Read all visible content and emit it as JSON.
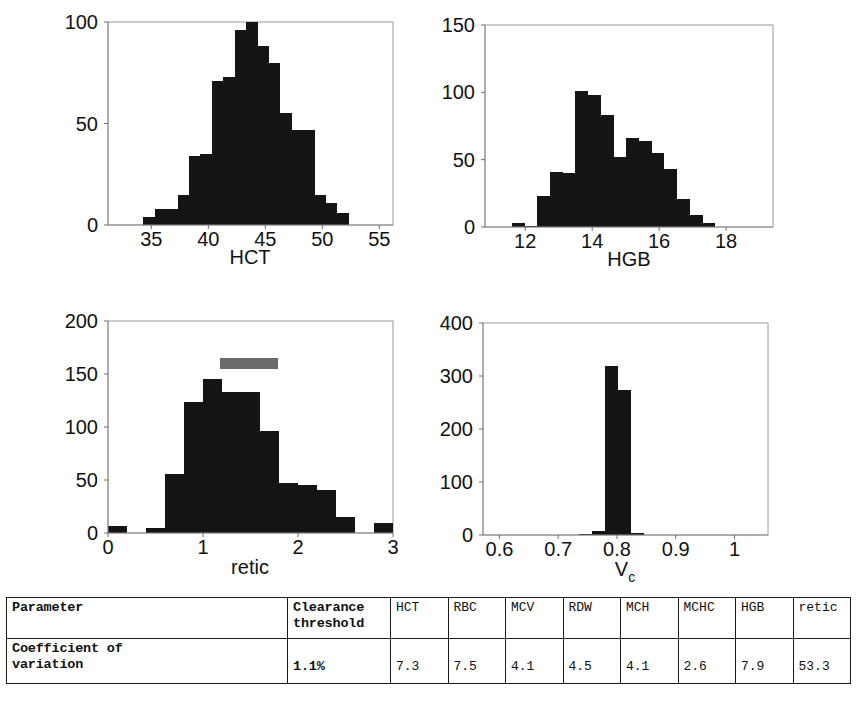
{
  "chart_data": [
    {
      "id": "hct",
      "type": "bar",
      "title": "",
      "xlabel": "HCT",
      "ylabel": "",
      "xlim": [
        31.2,
        56.2
      ],
      "ylim": [
        0,
        100
      ],
      "xticks": [
        35,
        40,
        45,
        50,
        55
      ],
      "xticklabels": [
        "35",
        "40",
        "45",
        "50",
        "55"
      ],
      "yticks": [
        0,
        50,
        100
      ],
      "yticklabels": [
        "0",
        "50",
        "100"
      ],
      "grid": false,
      "legend": "none",
      "bin_width": 1.02,
      "bin_starts": [
        34.3,
        35.3,
        36.3,
        37.3,
        38.3,
        39.3,
        40.3,
        41.3,
        42.3,
        43.3,
        44.3,
        45.3,
        46.3,
        47.3,
        48.3,
        49.3,
        50.3,
        51.3
      ],
      "values": [
        4,
        8,
        8,
        15,
        34,
        35,
        71,
        73,
        96,
        100,
        88,
        80,
        55,
        47,
        47,
        15,
        11,
        6
      ],
      "color": "#141414"
    },
    {
      "id": "hgb",
      "type": "bar",
      "title": "",
      "xlabel": "HGB",
      "ylabel": "",
      "xlim": [
        10.8,
        19.4
      ],
      "ylim": [
        0,
        150
      ],
      "xticks": [
        12,
        14,
        16,
        18
      ],
      "xticklabels": [
        "12",
        "14",
        "16",
        "18"
      ],
      "yticks": [
        0,
        50,
        100,
        150
      ],
      "yticklabels": [
        "0",
        "50",
        "100",
        "150"
      ],
      "grid": false,
      "legend": "none",
      "bin_width": 0.38,
      "bin_starts": [
        11.6,
        11.98,
        12.36,
        12.74,
        13.12,
        13.5,
        13.88,
        14.26,
        14.64,
        15.02,
        15.4,
        15.78,
        16.16,
        16.54,
        16.92,
        17.3
      ],
      "values": [
        3,
        1,
        23,
        41,
        40,
        101,
        98,
        83,
        52,
        66,
        64,
        55,
        43,
        21,
        9,
        3
      ],
      "color": "#141414"
    },
    {
      "id": "retic",
      "type": "bar",
      "title": "",
      "xlabel": "retic",
      "ylabel": "",
      "xlim": [
        0,
        3
      ],
      "ylim": [
        0,
        200
      ],
      "xticks": [
        0,
        1,
        2,
        3
      ],
      "xticklabels": [
        "0",
        "1",
        "2",
        "3"
      ],
      "yticks": [
        0,
        50,
        100,
        150,
        200
      ],
      "yticklabels": [
        "0",
        "50",
        "100",
        "150",
        "200"
      ],
      "grid": false,
      "legend": "none",
      "bin_width": 0.2,
      "bin_starts": [
        0.0,
        0.2,
        0.4,
        0.6,
        0.8,
        1.0,
        1.2,
        1.4,
        1.6,
        1.8,
        2.0,
        2.2,
        2.4,
        2.6,
        2.8
      ],
      "values": [
        7,
        0,
        5,
        56,
        124,
        145,
        133,
        133,
        96,
        47,
        45,
        41,
        15,
        0,
        9
      ],
      "color": "#141414",
      "annotations": [
        {
          "type": "marker-bar",
          "label": "",
          "x_start": 1.18,
          "x_end": 1.79,
          "y": 160,
          "color": "#6a6a6a"
        }
      ]
    },
    {
      "id": "vc",
      "type": "bar",
      "title": "",
      "xlabel": "V_c",
      "xlabel_base": "V",
      "xlabel_sub": "c",
      "ylabel": "",
      "xlim": [
        0.572,
        1.057
      ],
      "ylim": [
        0,
        400
      ],
      "xticks": [
        0.6,
        0.7,
        0.8,
        0.9,
        1.0
      ],
      "xticklabels": [
        "0.6",
        "0.7",
        "0.8",
        "0.9",
        "1"
      ],
      "yticks": [
        0,
        100,
        200,
        300,
        400
      ],
      "yticklabels": [
        "0",
        "100",
        "200",
        "300",
        "400"
      ],
      "grid": false,
      "legend": "none",
      "bin_width": 0.0222,
      "bin_starts": [
        0.7355,
        0.7577,
        0.7799,
        0.8021,
        0.8243
      ],
      "values": [
        1,
        7,
        318,
        273,
        3
      ],
      "color": "#141414"
    }
  ],
  "table": {
    "columns": [
      "Parameter",
      "Clearance\nthreshold",
      "HCT",
      "RBC",
      "MCV",
      "RDW",
      "MCH",
      "MCHC",
      "HGB",
      "retic"
    ],
    "header": {
      "parameter": "Parameter",
      "clearance_line1": "Clearance",
      "clearance_line2": "threshold",
      "measures": [
        "HCT",
        "RBC",
        "MCV",
        "RDW",
        "MCH",
        "MCHC",
        "HGB",
        "retic"
      ]
    },
    "rows": [
      {
        "label_line1": "Coefficient of",
        "label_line2": "variation",
        "clearance_threshold": "1.1%",
        "values": [
          "7.3",
          "7.5",
          "4.1",
          "4.5",
          "4.1",
          "2.6",
          "7.9",
          "53.3"
        ]
      }
    ]
  }
}
